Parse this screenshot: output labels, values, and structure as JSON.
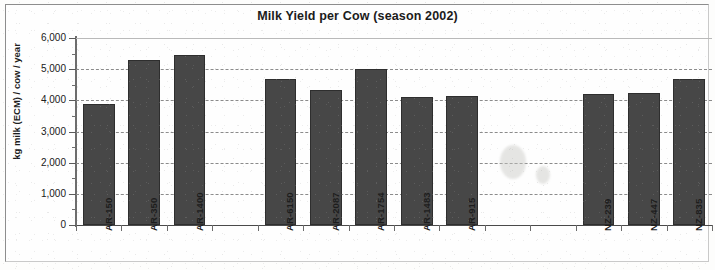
{
  "chart_data": {
    "type": "bar",
    "title": "Milk Yield per Cow (season 2002)",
    "xlabel": "",
    "ylabel": "kg milk (ECM) / cow / year",
    "ylim": [
      0,
      6000
    ],
    "ytick_step": 1000,
    "ytick_labels": [
      "6,000",
      "5,000",
      "4,000",
      "3,000",
      "2,000",
      "1,000",
      "0"
    ],
    "ytick_values": [
      6000,
      5000,
      4000,
      3000,
      2000,
      1000,
      0
    ],
    "grid": "horizontal dashed gridlines at every 1,000",
    "legend": "none",
    "bar_color": "#474747",
    "categories": [
      "AR-150",
      "AR-350",
      "AR-1400",
      "",
      "AR-6150",
      "AR-2087",
      "AR-1754",
      "AR-1483",
      "AR-915",
      "",
      "",
      "NZ-239",
      "NZ-447",
      "NZ-835"
    ],
    "values": [
      3880,
      5280,
      5450,
      null,
      4700,
      4340,
      5010,
      4110,
      4140,
      null,
      null,
      4210,
      4230,
      4680
    ]
  },
  "colors": {
    "bar": "#474747",
    "grid": "#8b8b8b",
    "axis": "#4a4a4a",
    "text": "#1b1b1b",
    "frame": "#8d8d8d"
  }
}
